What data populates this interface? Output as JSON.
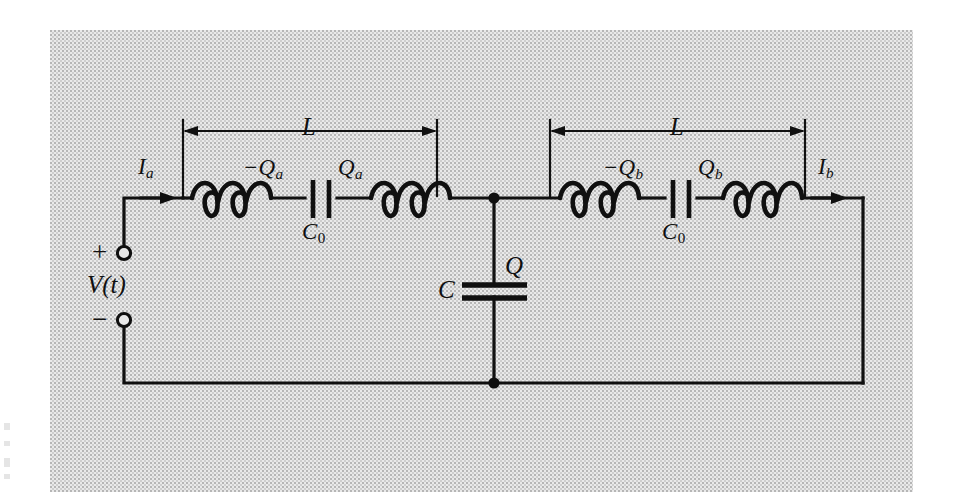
{
  "figure": {
    "type": "electrical-circuit-schematic",
    "background_color": "#e9e9e9",
    "ink_color": "#101010",
    "page_color": "#ffffff"
  },
  "source": {
    "label": "V(t)",
    "plus_sign": "+",
    "minus_sign": "−",
    "terminal_style": "open-circle"
  },
  "branch_a": {
    "current_label": "I",
    "current_subscript": "a",
    "span_label": "L",
    "inductor_count": 2,
    "inductor_loops": 3,
    "capacitor_label": "C",
    "capacitor_subscript": "0",
    "charge_negative": "−Q",
    "charge_negative_subscript": "a",
    "charge_positive": "Q",
    "charge_positive_subscript": "a"
  },
  "branch_b": {
    "current_label": "I",
    "current_subscript": "b",
    "span_label": "L",
    "inductor_count": 2,
    "inductor_loops": 3,
    "capacitor_label": "C",
    "capacitor_subscript": "0",
    "charge_negative": "−Q",
    "charge_negative_subscript": "b",
    "charge_positive": "Q",
    "charge_positive_subscript": "b"
  },
  "shunt": {
    "capacitor_label": "C",
    "charge_label": "Q",
    "orientation": "vertical",
    "plate_orientation": "horizontal"
  }
}
